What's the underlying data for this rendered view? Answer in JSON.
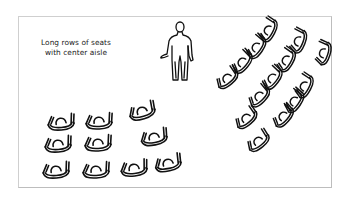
{
  "figure": {
    "caption_lines": [
      "Long rows of seats",
      "with center aisle"
    ],
    "colors": {
      "background": "#ffffff",
      "frame_border": "#cfcfcf",
      "ink": "#111111"
    },
    "elements": {
      "person": "standing-person-figure",
      "left_seat_group": {
        "rows": 3,
        "seats_per_row": [
          3,
          3,
          4
        ]
      },
      "right_seat_group": {
        "layout": "angled-rows",
        "seat_count": 14
      }
    }
  }
}
